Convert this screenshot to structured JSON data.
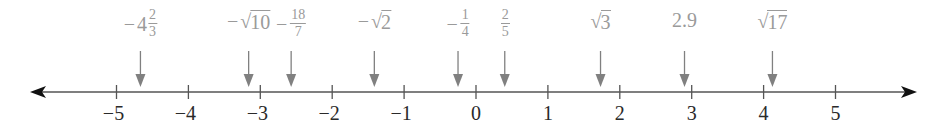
{
  "diagram": {
    "type": "number-line",
    "range": [
      -5,
      5
    ],
    "pixel_origin_x": 476,
    "pixels_per_unit": 71.9,
    "axis_y": 92,
    "line_color": "#555555",
    "arrow_color": "#111111",
    "pointer_color": "#808080",
    "label_color": "#9a9a9a",
    "ticks": [
      {
        "value": -5,
        "label": "−5"
      },
      {
        "value": -4,
        "label": "−4"
      },
      {
        "value": -3,
        "label": "−3"
      },
      {
        "value": -2,
        "label": "−2"
      },
      {
        "value": -1,
        "label": "−1"
      },
      {
        "value": 0,
        "label": "0"
      },
      {
        "value": 1,
        "label": "1"
      },
      {
        "value": 2,
        "label": "2"
      },
      {
        "value": 3,
        "label": "3"
      },
      {
        "value": 4,
        "label": "4"
      },
      {
        "value": 5,
        "label": "5"
      }
    ],
    "points": [
      {
        "id": "neg-4-2-3",
        "kind": "mixed",
        "sign": "−",
        "whole": "4",
        "num": "2",
        "den": "3",
        "value": -4.667
      },
      {
        "id": "neg-sqrt-10",
        "kind": "sqrt",
        "sign": "−",
        "radicand": "10",
        "value": -3.162
      },
      {
        "id": "neg-18-7",
        "kind": "frac",
        "sign": "−",
        "num": "18",
        "den": "7",
        "value": -2.571
      },
      {
        "id": "neg-sqrt-2",
        "kind": "sqrt",
        "sign": "−",
        "radicand": "2",
        "value": -1.414
      },
      {
        "id": "neg-1-4",
        "kind": "frac",
        "sign": "−",
        "num": "1",
        "den": "4",
        "value": -0.25
      },
      {
        "id": "2-5",
        "kind": "frac",
        "sign": "",
        "num": "2",
        "den": "5",
        "value": 0.4
      },
      {
        "id": "sqrt-3",
        "kind": "sqrt",
        "sign": "",
        "radicand": "3",
        "value": 1.732
      },
      {
        "id": "2-9",
        "kind": "decimal",
        "sign": "",
        "text": "2.9",
        "value": 2.9
      },
      {
        "id": "sqrt-17",
        "kind": "sqrt",
        "sign": "",
        "radicand": "17",
        "value": 4.123
      }
    ]
  }
}
